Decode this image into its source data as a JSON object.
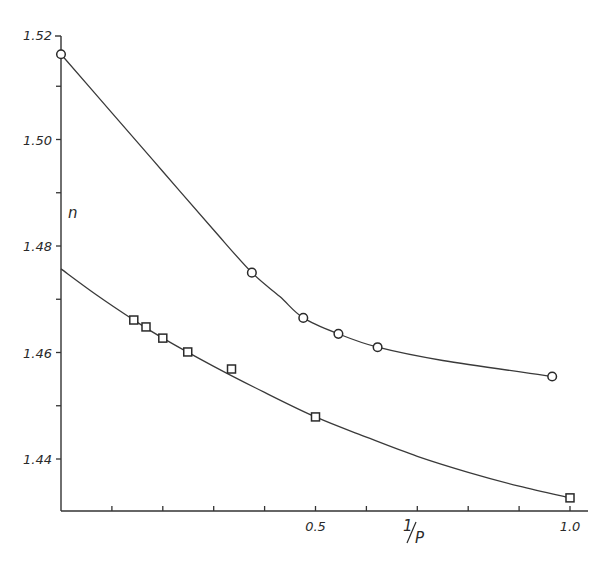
{
  "chart_data": {
    "type": "line",
    "title": "",
    "xlabel": "1/P",
    "ylabel": "n",
    "xlim": [
      0,
      1.0
    ],
    "ylim": [
      1.43,
      1.52
    ],
    "grid": false,
    "legend": null,
    "x_ticks": [
      0.1,
      0.2,
      0.3,
      0.4,
      0.5,
      0.6,
      0.7,
      0.8,
      0.9,
      1.0
    ],
    "x_tick_labels": [
      {
        "value": 0.5,
        "label": "0.5"
      },
      {
        "value": 1.0,
        "label": "1.0"
      }
    ],
    "y_ticks": [
      1.44,
      1.45,
      1.46,
      1.47,
      1.48,
      1.49,
      1.5,
      1.51,
      1.52
    ],
    "y_tick_labels": [
      {
        "value": 1.52,
        "label": "1.52"
      },
      {
        "value": 1.5,
        "label": "1.50"
      },
      {
        "value": 1.48,
        "label": "1.48"
      },
      {
        "value": 1.46,
        "label": "1.46"
      },
      {
        "value": 1.44,
        "label": "1.44"
      }
    ],
    "series": [
      {
        "name": "circles (upper curve)",
        "marker": "circle",
        "points": [
          {
            "x": 0.0,
            "y": 1.516
          },
          {
            "x": 0.375,
            "y": 1.475
          },
          {
            "x": 0.476,
            "y": 1.4665
          },
          {
            "x": 0.545,
            "y": 1.4635
          },
          {
            "x": 0.622,
            "y": 1.461
          },
          {
            "x": 0.965,
            "y": 1.4555
          }
        ],
        "curve": [
          {
            "x": 0.0,
            "y": 1.516
          },
          {
            "x": 0.1,
            "y": 1.505
          },
          {
            "x": 0.2,
            "y": 1.494
          },
          {
            "x": 0.3,
            "y": 1.483
          },
          {
            "x": 0.375,
            "y": 1.475
          },
          {
            "x": 0.43,
            "y": 1.4705
          },
          {
            "x": 0.476,
            "y": 1.4665
          },
          {
            "x": 0.545,
            "y": 1.4635
          },
          {
            "x": 0.622,
            "y": 1.461
          },
          {
            "x": 0.75,
            "y": 1.4585
          },
          {
            "x": 0.965,
            "y": 1.4555
          }
        ]
      },
      {
        "name": "squares (lower curve)",
        "marker": "square",
        "points": [
          {
            "x": 0.143,
            "y": 1.4661
          },
          {
            "x": 0.167,
            "y": 1.4648
          },
          {
            "x": 0.2,
            "y": 1.4627
          },
          {
            "x": 0.249,
            "y": 1.4601
          },
          {
            "x": 0.335,
            "y": 1.4569
          },
          {
            "x": 0.5,
            "y": 1.4479
          },
          {
            "x": 1.0,
            "y": 1.4327
          }
        ],
        "curve": [
          {
            "x": 0.0,
            "y": 1.4757
          },
          {
            "x": 0.07,
            "y": 1.4708
          },
          {
            "x": 0.143,
            "y": 1.4661
          },
          {
            "x": 0.2,
            "y": 1.4627
          },
          {
            "x": 0.3,
            "y": 1.4574
          },
          {
            "x": 0.4,
            "y": 1.4525
          },
          {
            "x": 0.5,
            "y": 1.4479
          },
          {
            "x": 0.6,
            "y": 1.4441
          },
          {
            "x": 0.7,
            "y": 1.4405
          },
          {
            "x": 0.8,
            "y": 1.4375
          },
          {
            "x": 0.9,
            "y": 1.4349
          },
          {
            "x": 1.0,
            "y": 1.4327
          }
        ]
      }
    ]
  },
  "labels": {
    "y_axis": "n",
    "x_axis": "1/P"
  }
}
